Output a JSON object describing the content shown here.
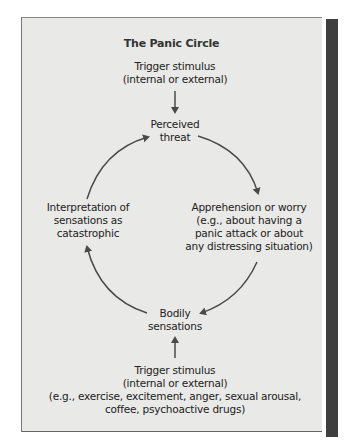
{
  "diagram": {
    "title": "The Panic Circle",
    "nodes": {
      "trigger_top": {
        "line1": "Trigger stimulus",
        "line2": "(internal or external)"
      },
      "perceived_threat": {
        "line1": "Perceived",
        "line2": "threat"
      },
      "apprehension": {
        "line1": "Apprehension or worry",
        "line2": "(e.g., about having a",
        "line3": "panic attack or about",
        "line4": "any distressing situation)"
      },
      "bodily_sensations": {
        "line1": "Bodily",
        "line2": "sensations"
      },
      "interpretation": {
        "line1": "Interpretation of",
        "line2": "sensations as",
        "line3": "catastrophic"
      },
      "trigger_bottom": {
        "line1": "Trigger stimulus",
        "line2": "(internal or external)",
        "line3": "(e.g., exercise, excitement, anger, sexual arousal,",
        "line4": "coffee, psychoactive drugs)"
      }
    },
    "edges": [
      {
        "from": "trigger_top",
        "to": "perceived_threat"
      },
      {
        "from": "perceived_threat",
        "to": "apprehension"
      },
      {
        "from": "apprehension",
        "to": "bodily_sensations"
      },
      {
        "from": "bodily_sensations",
        "to": "interpretation"
      },
      {
        "from": "interpretation",
        "to": "perceived_threat"
      },
      {
        "from": "trigger_bottom",
        "to": "bodily_sensations"
      }
    ],
    "colors": {
      "background": "#e9e9e7",
      "arrow": "#4a4a4a",
      "text": "#222222",
      "side_bar": "#3e3e3e"
    }
  }
}
